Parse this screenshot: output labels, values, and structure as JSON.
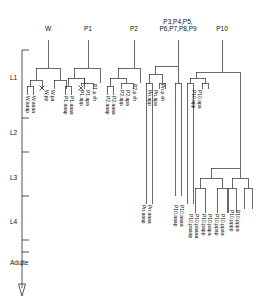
{
  "figure": {
    "title": "",
    "type": "cell-lineage-tree",
    "axis": {
      "name": "developmental-stage-axis",
      "stages": [
        {
          "label": "L1",
          "y": 78
        },
        {
          "label": "L2",
          "y": 133
        },
        {
          "label": "L3",
          "y": 178
        },
        {
          "label": "L4",
          "y": 222
        },
        {
          "label": "Adulte",
          "y": 263
        }
      ],
      "ticks_y": [
        50,
        118,
        152,
        196,
        240,
        252
      ],
      "arrow_end": "Adulte"
    },
    "top_labels": [
      {
        "name": "W",
        "text": "W",
        "x": 48
      },
      {
        "name": "P1",
        "text": "P1",
        "x": 88
      },
      {
        "name": "P2",
        "text": "P2",
        "x": 134
      },
      {
        "name": "P3-P9",
        "text": "P3,P4,P5,\nP6,P7,P8,P9",
        "x": 178
      },
      {
        "name": "P10",
        "text": "P10",
        "x": 222
      }
    ],
    "leaf_labels": [
      {
        "text": "W.aaap",
        "x": 30,
        "y": 96
      },
      {
        "text": "W.aaaa",
        "x": 36,
        "y": 96
      },
      {
        "text": "W.pp",
        "x": 49,
        "y": 90
      },
      {
        "text": "W.pa",
        "x": 55,
        "y": 90
      },
      {
        "text": "P1.aaap",
        "x": 68,
        "y": 96
      },
      {
        "text": "P1.aaaa",
        "x": 74,
        "y": 96
      },
      {
        "text": "P1.app",
        "x": 84,
        "y": 90
      },
      {
        "text": "P1.apa",
        "x": 90,
        "y": 90
      },
      {
        "text": "P1.p.vh",
        "x": 97,
        "y": 84
      },
      {
        "text": "P2.aaap",
        "x": 110,
        "y": 96
      },
      {
        "text": "P2.aaaa",
        "x": 116,
        "y": 96
      },
      {
        "text": "P2.app",
        "x": 124,
        "y": 90
      },
      {
        "text": "P2.apa",
        "x": 130,
        "y": 90
      },
      {
        "text": "P2.p.vh",
        "x": 137,
        "y": 84
      },
      {
        "text": "Pn.app",
        "x": 152,
        "y": 90
      },
      {
        "text": "Pn.apa",
        "x": 158,
        "y": 90
      },
      {
        "text": "Pn.p.vh",
        "x": 165,
        "y": 84
      },
      {
        "text": "Pn.aaap",
        "x": 146,
        "y": 205
      },
      {
        "text": "Pn.aaaa",
        "x": 152,
        "y": 205
      },
      {
        "text": "P10.app",
        "x": 196,
        "y": 90
      },
      {
        "text": "P10.apa",
        "x": 202,
        "y": 90
      },
      {
        "text": "P10.aaap",
        "x": 178,
        "y": 205
      },
      {
        "text": "P10.aaaa",
        "x": 184,
        "y": 205
      },
      {
        "text": "P10.paaap",
        "x": 193,
        "y": 214
      },
      {
        "text": "P10.paaaa",
        "x": 199,
        "y": 214
      },
      {
        "text": "P10.papp",
        "x": 206,
        "y": 214
      },
      {
        "text": "P10.papa",
        "x": 212,
        "y": 214
      },
      {
        "text": "P10.ppap",
        "x": 219,
        "y": 214
      },
      {
        "text": "P10.ppaa",
        "x": 225,
        "y": 214
      },
      {
        "text": "P10.pppp",
        "x": 234,
        "y": 210
      },
      {
        "text": "P10.pppa",
        "x": 240,
        "y": 210
      }
    ],
    "x_marks": [
      {
        "name": "apoptosis-mark-W",
        "x": 45,
        "y": 88
      },
      {
        "name": "apoptosis-mark-P1",
        "x": 81,
        "y": 88
      }
    ]
  }
}
